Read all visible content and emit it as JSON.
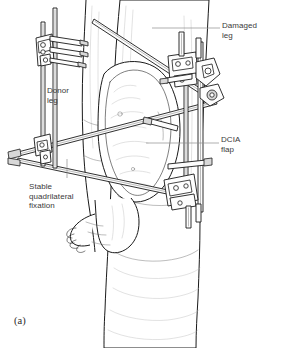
{
  "figure": {
    "domain": "medical-illustration",
    "caption": "(a)",
    "background_color": "#ffffff",
    "ink_color": "#1a1a1a",
    "label_color": "#3a3a3a",
    "leader_color": "#8c8c8c",
    "shading_color": "#bdbdbd"
  },
  "labels": {
    "damaged_leg": "Damaged\nleg",
    "donor_leg": "Donor\nleg",
    "dcia_flap": "DCIA\nflap",
    "stable_fixation": "Stable\nquadrilateral\nfixation"
  },
  "anatomy": {
    "damaged_leg_name": "damaged-leg-limb",
    "donor_leg_name": "donor-leg-limb",
    "flap_name": "dcia-flap-tissue",
    "foot_name": "foot"
  },
  "hardware": {
    "clamps": [
      "upper-left-clamp",
      "upper-right-clamp-cluster",
      "mid-left-clamp",
      "lower-right-clamp"
    ],
    "rods": [
      "upper-diagonal-rod",
      "mid-horizontal-rod",
      "lower-diagonal-rod",
      "left-vertical-rod",
      "right-vertical-rod"
    ],
    "pin_count": 3
  }
}
